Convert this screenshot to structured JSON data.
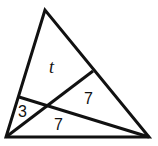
{
  "diagram": {
    "type": "triangle-with-cevians",
    "regions": [
      {
        "id": "top-quad",
        "label": "t"
      },
      {
        "id": "left-small",
        "label": "3"
      },
      {
        "id": "right-triangle",
        "label": "7"
      },
      {
        "id": "bottom-triangle",
        "label": "7"
      }
    ],
    "line_color": "#111111"
  }
}
